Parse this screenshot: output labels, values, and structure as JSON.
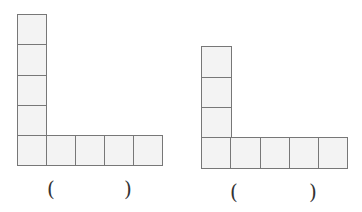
{
  "figures": [
    {
      "name": "left-l-shape",
      "vertical_squares": 5,
      "horizontal_squares": 5,
      "answer_open": "(",
      "answer_close": ")"
    },
    {
      "name": "right-l-shape",
      "vertical_squares": 4,
      "horizontal_squares": 5,
      "answer_open": "(",
      "answer_close": ")"
    }
  ]
}
